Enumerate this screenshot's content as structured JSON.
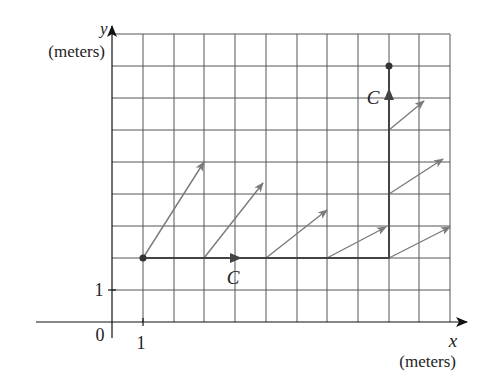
{
  "diagram": {
    "type": "vector-field-line-integral",
    "axes": {
      "x_label": "x",
      "x_unit": "(meters)",
      "y_label": "y",
      "y_unit": "(meters)",
      "origin_label": "0",
      "x_tick_label": "1",
      "y_tick_label": "1"
    },
    "grid": {
      "columns": 11,
      "rows": 9,
      "unit_px_x": 30.8,
      "unit_px_y": 32
    },
    "curve": {
      "label_horizontal": "C",
      "label_vertical": "C",
      "start_point": [
        1,
        2
      ],
      "corner_point": [
        9,
        2
      ],
      "end_point": [
        9,
        8
      ],
      "color": "#444444"
    },
    "vectors": {
      "color": "#7a7a7a",
      "items": [
        {
          "from": [
            1,
            2
          ],
          "to": [
            3,
            5
          ]
        },
        {
          "from": [
            3,
            2
          ],
          "to": [
            4.9,
            4.35
          ]
        },
        {
          "from": [
            5,
            2
          ],
          "to": [
            7,
            3.5
          ]
        },
        {
          "from": [
            7,
            2
          ],
          "to": [
            8.9,
            3
          ]
        },
        {
          "from": [
            9,
            2
          ],
          "to": [
            11,
            3
          ]
        },
        {
          "from": [
            9,
            4
          ],
          "to": [
            10.75,
            5.1
          ]
        },
        {
          "from": [
            9,
            6
          ],
          "to": [
            10.15,
            6.9
          ]
        }
      ]
    }
  }
}
